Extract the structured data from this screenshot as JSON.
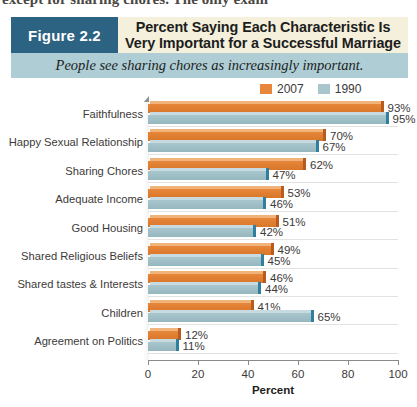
{
  "page": {
    "cut_off_line": "except for sharing chores. The only exam"
  },
  "header": {
    "figure_label": "Figure 2.2",
    "title": "Percent Saying Each Characteristic Is Very Important for a Successful Marriage",
    "subtitle": "People see sharing chores as increasingly important.",
    "figure_box_color": "#2d6382",
    "title_band_color": "#f4f0dc",
    "subtitle_band_color": "#aecdd4"
  },
  "legend": [
    {
      "name": "legend-2007",
      "label": "2007",
      "color": "#e8873b"
    },
    {
      "name": "legend-1990",
      "label": "1990",
      "color": "#a9c6cd"
    }
  ],
  "chart_data": {
    "type": "bar",
    "orientation": "horizontal",
    "title": "Percent Saying Each Characteristic Is Very Important for a Successful Marriage",
    "subtitle": "People see sharing chores as increasingly important.",
    "xlabel": "Percent",
    "ylabel": "",
    "xlim": [
      0,
      100
    ],
    "xticks": [
      0,
      20,
      40,
      60,
      80,
      100
    ],
    "xticklabels": [
      "0",
      "20",
      "40",
      "60",
      "80",
      "100"
    ],
    "grid": true,
    "legend_position": "top-right",
    "categories": [
      "Faithfulness",
      "Happy Sexual Relationship",
      "Sharing Chores",
      "Adequate Income",
      "Good Housing",
      "Shared Religious Beliefs",
      "Shared tastes & Interests",
      "Children",
      "Agreement on Politics"
    ],
    "series": [
      {
        "name": "2007",
        "color": "#e8873b",
        "values": [
          93,
          70,
          62,
          53,
          51,
          49,
          46,
          41,
          12
        ],
        "labels": [
          "93%",
          "70%",
          "62%",
          "53%",
          "51%",
          "49%",
          "46%",
          "41%",
          "12%"
        ]
      },
      {
        "name": "1990",
        "color": "#a9c6cd",
        "values": [
          95,
          67,
          47,
          46,
          42,
          45,
          44,
          65,
          11
        ],
        "labels": [
          "95%",
          "67%",
          "47%",
          "46%",
          "42%",
          "45%",
          "44%",
          "65%",
          "11%"
        ]
      }
    ]
  }
}
